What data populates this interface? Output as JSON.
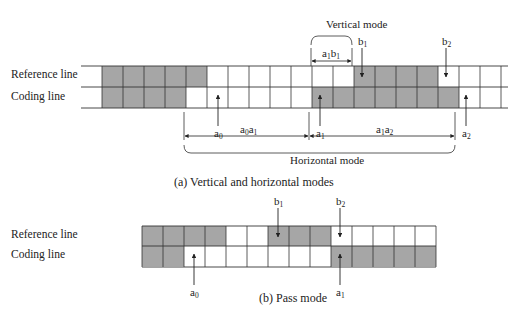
{
  "figure_a": {
    "caption": "(a) Vertical and horizontal modes",
    "row_labels": {
      "reference": "Reference line",
      "coding": "Coding line"
    },
    "cell_width": 21,
    "grid_start_x": 102,
    "reference_cells": [
      "g",
      "g",
      "g",
      "g",
      "g",
      "w",
      "w",
      "w",
      "w",
      "w",
      "w",
      "w",
      "g",
      "g",
      "g",
      "g",
      "w",
      "w",
      "w"
    ],
    "coding_cells": [
      "g",
      "g",
      "g",
      "g",
      "w",
      "w",
      "w",
      "w",
      "w",
      "w",
      "g",
      "g",
      "g",
      "g",
      "g",
      "g",
      "g",
      "w",
      "w"
    ],
    "points": [
      {
        "name": "a",
        "sub": "0",
        "row": "coding",
        "x": 218
      },
      {
        "name": "a",
        "sub": "1",
        "row": "coding",
        "x": 320
      },
      {
        "name": "a",
        "sub": "2",
        "row": "coding",
        "x": 466
      },
      {
        "name": "b",
        "sub": "1",
        "row": "reference",
        "x": 362
      },
      {
        "name": "b",
        "sub": "2",
        "row": "reference",
        "x": 446
      }
    ],
    "spans": [
      {
        "label": "a",
        "sub1": "0",
        "label2": "a",
        "sub2": "1",
        "text": "a0a1"
      },
      {
        "label": "a",
        "sub1": "1",
        "label2": "a",
        "sub2": "2",
        "text": "a1a2"
      },
      {
        "label": "a",
        "sub1": "1",
        "label2": "b",
        "sub2": "1",
        "text": "a1b1"
      }
    ],
    "vertical_mode_label": "Vertical mode",
    "horizontal_mode_label": "Horizontal mode"
  },
  "figure_b": {
    "caption": "(b) Pass mode",
    "row_labels": {
      "reference": "Reference line",
      "coding": "Coding line"
    },
    "cell_width": 21,
    "grid_start_x": 142,
    "reference_cells": [
      "g",
      "g",
      "g",
      "g",
      "w",
      "w",
      "g",
      "g",
      "g",
      "w",
      "w",
      "w",
      "w",
      "w"
    ],
    "coding_cells": [
      "g",
      "g",
      "w",
      "w",
      "w",
      "w",
      "w",
      "w",
      "w",
      "g",
      "g",
      "g",
      "g",
      "g"
    ],
    "points": [
      {
        "name": "a",
        "sub": "0",
        "row": "coding",
        "x": 194
      },
      {
        "name": "a",
        "sub": "1",
        "row": "coding",
        "x": 340
      },
      {
        "name": "b",
        "sub": "1",
        "row": "reference",
        "x": 278
      },
      {
        "name": "b",
        "sub": "2",
        "row": "reference",
        "x": 340
      }
    ]
  },
  "colors": {
    "shaded": "#a6a6a6",
    "line": "#333333",
    "white": "#ffffff"
  }
}
